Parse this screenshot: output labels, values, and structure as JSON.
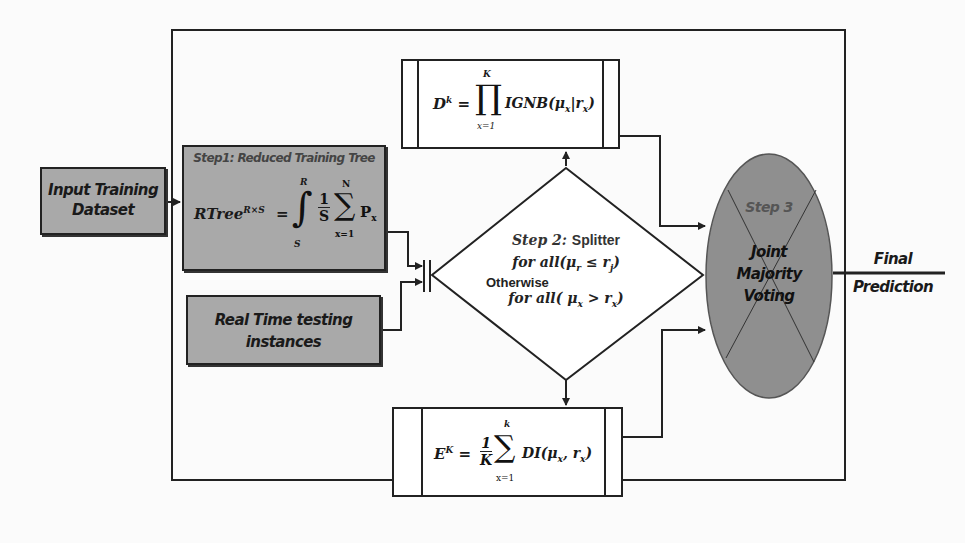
{
  "diagram": {
    "input_box": {
      "label_line1": "Input Training",
      "label_line2": "Dataset"
    },
    "step1": {
      "title": "Step1: Reduced Training Tree",
      "formula_lhs": "RTree",
      "formula_lhs_sup": "R×S",
      "integral_upper": "R",
      "integral_lower": "S",
      "fraction_num": "1",
      "fraction_den": "S",
      "sum_upper": "N",
      "sum_lower": "x=1",
      "term": "P",
      "term_sub": "x"
    },
    "realtime_box": {
      "label_line1": "Real Time testing",
      "label_line2": "instances"
    },
    "d_box": {
      "lhs": "D",
      "lhs_sup": "k",
      "prod_upper": "K",
      "prod_lower": "x=1",
      "rhs": "IGNB(μ",
      "rhs_sub1": "x",
      "rhs_mid": "|r",
      "rhs_sub2": "x",
      "rhs_end": ")"
    },
    "splitter": {
      "step": "Step 2:",
      "name": "Splitter",
      "cond1": "for all(μ",
      "cond1_sub1": "r",
      "cond1_mid": " ≤ r",
      "cond1_sub2": "j",
      "cond1_end": ")",
      "otherwise": "Otherwise",
      "cond2": "for all( μ",
      "cond2_sub1": "x",
      "cond2_mid": " > r",
      "cond2_sub2": "x",
      "cond2_end": ")"
    },
    "e_box": {
      "lhs": "E",
      "lhs_sup": "K",
      "fraction_num": "1",
      "fraction_den": "K",
      "sum_upper": "k",
      "sum_lower": "x=1",
      "rhs": "DI(μ",
      "rhs_sub1": "x",
      "rhs_mid": ", r",
      "rhs_sub2": "x",
      "rhs_end": ")"
    },
    "step3": {
      "title": "Step 3",
      "line1": "Joint",
      "line2": "Majority",
      "line3": "Voting"
    },
    "output": {
      "line1": "Final",
      "line2": "Prediction"
    },
    "colors": {
      "box_fill": "#a9a9a9",
      "ellipse_fill": "#8f8f8f",
      "stroke": "#222222"
    }
  }
}
